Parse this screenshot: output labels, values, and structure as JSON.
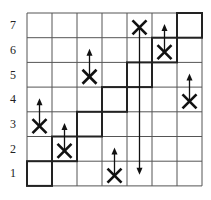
{
  "grid": {
    "rows": 7,
    "cols": 7,
    "row_labels": [
      "7",
      "6",
      "5",
      "4",
      "3",
      "2",
      "1"
    ],
    "line_color": "#555555",
    "bold_color": "#222222"
  },
  "bold_cells": [
    {
      "col": 1,
      "row": 1
    },
    {
      "col": 2,
      "row": 2
    },
    {
      "col": 3,
      "row": 3
    },
    {
      "col": 4,
      "row": 4
    },
    {
      "col": 5,
      "row": 5
    },
    {
      "col": 6,
      "row": 6
    },
    {
      "col": 7,
      "row": 7
    }
  ],
  "markers": [
    {
      "col": 1,
      "row": 3,
      "arrow": "up",
      "arrow_to_row": 4
    },
    {
      "col": 2,
      "row": 2,
      "arrow": "up",
      "arrow_to_row": 3
    },
    {
      "col": 3,
      "row": 5,
      "arrow": "up",
      "arrow_to_row": 6
    },
    {
      "col": 4,
      "row": 1,
      "arrow": "up",
      "arrow_to_row": 2
    },
    {
      "col": 5,
      "row": 7,
      "arrow": "down",
      "arrow_to_row": 1
    },
    {
      "col": 6,
      "row": 6,
      "arrow": "up",
      "arrow_to_row": 7
    },
    {
      "col": 7,
      "row": 4,
      "arrow": "up",
      "arrow_to_row": 5
    }
  ],
  "marker_symbol": "X"
}
